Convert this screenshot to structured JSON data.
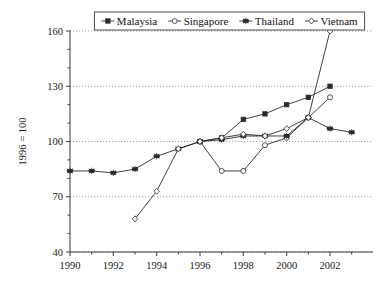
{
  "chart_data": {
    "type": "line",
    "title": "",
    "subtitle": "",
    "xlabel": "",
    "ylabel": "1996 = 100",
    "x": [
      1990,
      1991,
      1992,
      1993,
      1994,
      1995,
      1996,
      1997,
      1998,
      1999,
      2000,
      2001,
      2002,
      2003
    ],
    "xlim": [
      1989.6,
      2003.4
    ],
    "ylim": [
      40,
      160
    ],
    "yticks": [
      40,
      70,
      100,
      130,
      160
    ],
    "yticklabels": [
      "40",
      "70",
      "100",
      "130",
      "160"
    ],
    "xticks": [
      1990,
      1992,
      1994,
      1996,
      1998,
      2000,
      2002
    ],
    "xticklabels": [
      "1990",
      "1992",
      "1994",
      "1996",
      "1998",
      "2000",
      "2002"
    ],
    "minor_xticks": [
      1991,
      1993,
      1995,
      1997,
      1999,
      2001,
      2003
    ],
    "minor_yticks": [
      50,
      60,
      80,
      90,
      110,
      120,
      140,
      150
    ],
    "grid": "horizontal-major-dotted",
    "legend_position": "top-center-inside",
    "series": [
      {
        "name": "Malaysia",
        "marker": "filled-square",
        "x": [
          1996,
          1997,
          1998,
          1999,
          2000,
          2001,
          2002
        ],
        "values": [
          100,
          102,
          112,
          115,
          120,
          124,
          130
        ]
      },
      {
        "name": "Singapore",
        "marker": "open-circle",
        "x": [
          1996,
          1997,
          1998,
          1999,
          2000,
          2001,
          2002
        ],
        "values": [
          100,
          84,
          84,
          98,
          102,
          113,
          124
        ]
      },
      {
        "name": "Thailand",
        "marker": "star",
        "x": [
          1990,
          1991,
          1992,
          1993,
          1994,
          1995,
          1996,
          1997,
          1998,
          1999,
          2000,
          2001,
          2002,
          2003
        ],
        "values": [
          84,
          84,
          83,
          85,
          92,
          96,
          100,
          101,
          103,
          103,
          103,
          113,
          107,
          105
        ]
      },
      {
        "name": "Vietnam",
        "marker": "open-diamond",
        "x": [
          1993,
          1994,
          1995,
          1996,
          1997,
          1998,
          1999,
          2000,
          2001,
          2002
        ],
        "values": [
          58,
          73,
          96,
          100,
          102,
          104,
          103,
          107,
          113,
          160
        ]
      }
    ]
  },
  "legend": {
    "entries": [
      {
        "label": "Malaysia",
        "marker": "filled-square"
      },
      {
        "label": "Singapore",
        "marker": "open-circle"
      },
      {
        "label": "Thailand",
        "marker": "star"
      },
      {
        "label": "Vietnam",
        "marker": "open-diamond"
      }
    ]
  }
}
